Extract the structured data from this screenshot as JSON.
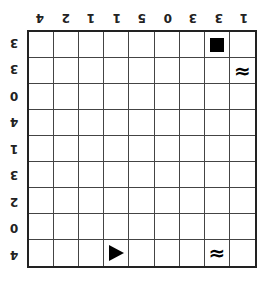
{
  "puzzle": {
    "rows": 9,
    "cols": 9,
    "orientation": "rotated-180",
    "column_clues": [
      "4",
      "2",
      "1",
      "1",
      "5",
      "0",
      "3",
      "3",
      "1"
    ],
    "row_clues": [
      "3",
      "3",
      "0",
      "4",
      "1",
      "3",
      "2",
      "0",
      "4"
    ],
    "cells": [
      {
        "row": 0,
        "col": 7,
        "symbol": "block",
        "icon": "black-square-icon"
      },
      {
        "row": 1,
        "col": 8,
        "symbol": "wave",
        "icon": "wave-icon",
        "glyph": "≈"
      },
      {
        "row": 8,
        "col": 3,
        "symbol": "arrow",
        "icon": "triangle-right-icon"
      },
      {
        "row": 8,
        "col": 7,
        "symbol": "wave",
        "icon": "wave-icon",
        "glyph": "≈"
      }
    ],
    "colors": {
      "grid_line": "#444444",
      "border": "#222222",
      "symbol": "#000000",
      "background": "#ffffff"
    }
  }
}
